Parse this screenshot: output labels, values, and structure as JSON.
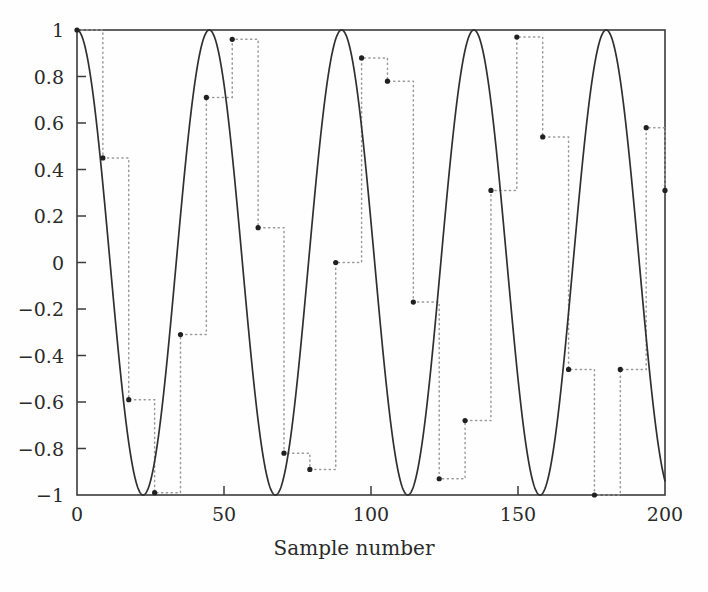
{
  "chart_data": {
    "type": "line",
    "title": "",
    "xlabel": "Sample number",
    "ylabel": "",
    "xlim": [
      0,
      200
    ],
    "ylim": [
      -1,
      1
    ],
    "xticks": [
      0,
      50,
      100,
      150,
      200
    ],
    "xtick_labels": [
      "0",
      "50",
      "100",
      "150",
      "200"
    ],
    "yticks": [
      -1,
      -0.8,
      -0.6,
      -0.4,
      -0.2,
      0,
      0.2,
      0.4,
      0.6,
      0.8,
      1
    ],
    "ytick_labels": [
      "-1",
      "-0.8",
      "-0.6",
      "-0.4",
      "-0.2",
      "0",
      "0.2",
      "0.4",
      "0.6",
      "0.8",
      "1"
    ],
    "grid": false,
    "legend": null,
    "series": [
      {
        "name": "continuous-sinusoid",
        "style": "solid",
        "color": "#303030",
        "description": "cos(2*pi*n/45), continuous solid curve",
        "formula": {
          "type": "cosine",
          "amplitude": 1.0,
          "period_samples": 45,
          "phase": 0
        }
      },
      {
        "name": "sampled-hold",
        "style": "dotted-staircase-with-markers",
        "color": "#9a9a9a",
        "marker": "dot",
        "marker_color": "#202020",
        "description": "zero-order-hold of samples taken every 8.8 samples",
        "sample_interval": 8.8,
        "samples": [
          {
            "x": 0.0,
            "y": 1.0
          },
          {
            "x": 8.8,
            "y": 0.45
          },
          {
            "x": 17.6,
            "y": -0.59
          },
          {
            "x": 26.4,
            "y": -0.99
          },
          {
            "x": 35.2,
            "y": -0.31
          },
          {
            "x": 44.0,
            "y": 0.71
          },
          {
            "x": 52.8,
            "y": 0.96
          },
          {
            "x": 61.6,
            "y": 0.15
          },
          {
            "x": 70.4,
            "y": -0.82
          },
          {
            "x": 79.2,
            "y": -0.89
          },
          {
            "x": 88.0,
            "y": 0.0
          },
          {
            "x": 96.8,
            "y": 0.88
          },
          {
            "x": 105.6,
            "y": 0.78
          },
          {
            "x": 114.4,
            "y": -0.17
          },
          {
            "x": 123.2,
            "y": -0.93
          },
          {
            "x": 132.0,
            "y": -0.68
          },
          {
            "x": 140.8,
            "y": 0.31
          },
          {
            "x": 149.6,
            "y": 0.97
          },
          {
            "x": 158.4,
            "y": 0.54
          },
          {
            "x": 167.2,
            "y": -0.46
          },
          {
            "x": 176.0,
            "y": -1.0
          },
          {
            "x": 184.8,
            "y": -0.46
          },
          {
            "x": 193.6,
            "y": 0.58
          },
          {
            "x": 200.0,
            "y": 0.31
          }
        ]
      }
    ]
  },
  "axis": {
    "x_title": "Sample number"
  }
}
